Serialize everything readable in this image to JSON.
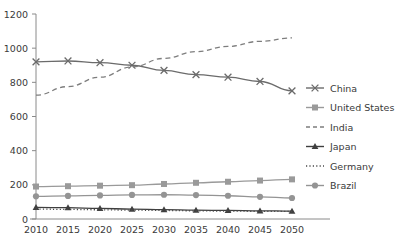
{
  "chart_data": {
    "type": "line",
    "title": "",
    "xlabel": "",
    "ylabel": "",
    "x": [
      2010,
      2015,
      2020,
      2025,
      2030,
      2035,
      2040,
      2045,
      2050
    ],
    "xtick_labels": [
      "2010",
      "2015",
      "2020",
      "2025",
      "2030",
      "2035",
      "2040",
      "2045",
      "2050"
    ],
    "ytick_labels": [
      "0",
      "200",
      "400",
      "600",
      "800",
      "1000",
      "1200"
    ],
    "yticks": [
      0,
      200,
      400,
      600,
      800,
      1000,
      1200
    ],
    "ylim": [
      0,
      1200
    ],
    "xlim": [
      2010,
      2050
    ],
    "grid": false,
    "legend_position": "right",
    "series": [
      {
        "name": "China",
        "marker": "x",
        "linestyle": "solid",
        "color": "#6b6b6b",
        "values": [
          920,
          925,
          915,
          900,
          870,
          845,
          830,
          805,
          750
        ]
      },
      {
        "name": "United States",
        "marker": "square",
        "linestyle": "solid",
        "color": "#9a9a9a",
        "values": [
          190,
          192,
          195,
          198,
          205,
          212,
          218,
          225,
          232
        ]
      },
      {
        "name": "India",
        "marker": "none",
        "linestyle": "dashed",
        "color": "#7d7d7d",
        "values": [
          725,
          775,
          830,
          890,
          940,
          980,
          1010,
          1040,
          1060
        ]
      },
      {
        "name": "Japan",
        "marker": "triangle",
        "linestyle": "solid",
        "color": "#3f3f3f",
        "values": [
          68,
          66,
          62,
          58,
          55,
          52,
          50,
          48,
          46
        ]
      },
      {
        "name": "Germany",
        "marker": "none",
        "linestyle": "dotted",
        "color": "#4a4a4a",
        "values": [
          58,
          56,
          54,
          52,
          50,
          48,
          46,
          45,
          44
        ]
      },
      {
        "name": "Brazil",
        "marker": "circle",
        "linestyle": "solid",
        "color": "#949494",
        "values": [
          133,
          135,
          138,
          141,
          142,
          140,
          136,
          130,
          123
        ]
      }
    ]
  },
  "legend": {
    "entries": [
      {
        "label": "China"
      },
      {
        "label": "United States"
      },
      {
        "label": "India"
      },
      {
        "label": "Japan"
      },
      {
        "label": "Germany"
      },
      {
        "label": "Brazil"
      }
    ]
  },
  "colors": {
    "axis": "#8a8a8a",
    "text": "#3a3a3a",
    "background": "#ffffff"
  }
}
